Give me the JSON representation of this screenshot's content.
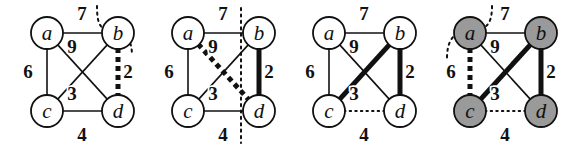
{
  "figure": {
    "title": "",
    "width": 564,
    "height": 147,
    "background": "#ffffff",
    "ink_color": "#111111",
    "node_fill_white": "#ffffff",
    "node_fill_gray": "#9a9a9a"
  },
  "graph": {
    "nodes": [
      {
        "id": "a",
        "label": "a",
        "x": 47,
        "y": 33
      },
      {
        "id": "b",
        "label": "b",
        "x": 118,
        "y": 33
      },
      {
        "id": "c",
        "label": "c",
        "x": 47,
        "y": 111
      },
      {
        "id": "d",
        "label": "d",
        "x": 118,
        "y": 111
      }
    ],
    "node_radius": 16,
    "edges": [
      {
        "id": "ab",
        "from": "a",
        "to": "b",
        "weight": 7,
        "label": "7",
        "label_x": 82,
        "label_y": 20
      },
      {
        "id": "ac",
        "from": "a",
        "to": "c",
        "weight": 6,
        "label": "6",
        "label_x": 28,
        "label_y": 78
      },
      {
        "id": "ad",
        "from": "a",
        "to": "d",
        "weight": 9,
        "label": "9",
        "label_x": 72,
        "label_y": 53
      },
      {
        "id": "bc",
        "from": "b",
        "to": "c",
        "weight": 3,
        "label": "3",
        "label_x": 72,
        "label_y": 100
      },
      {
        "id": "bd",
        "from": "b",
        "to": "d",
        "weight": 2,
        "label": "2",
        "label_x": 128,
        "label_y": 78
      },
      {
        "id": "cd",
        "from": "c",
        "to": "d",
        "weight": 4,
        "label": "4",
        "label_x": 82,
        "label_y": 141
      }
    ]
  },
  "panels": [
    {
      "index": 1,
      "name": "panel-1",
      "offset_x": 0,
      "node_style": "white",
      "edge_styles": {
        "ab": "thin-solid",
        "ac": "thin-solid",
        "ad": "thin-solid",
        "bc": "thin-solid",
        "bd": "bold-dashed",
        "cd": "thin-solid"
      },
      "cut": {
        "type": "curved",
        "visible": true
      },
      "highlighted_edges": [
        "bd"
      ],
      "highlighted_nodes": []
    },
    {
      "index": 2,
      "name": "panel-2",
      "offset_x": 141,
      "node_style": "white",
      "edge_styles": {
        "ab": "thin-solid",
        "ac": "thin-solid",
        "ad": "bold-dashed",
        "bc": "thin-solid",
        "bd": "thick-solid",
        "cd": "thin-solid"
      },
      "cut": {
        "type": "vertical",
        "visible": true
      },
      "highlighted_edges": [
        "bd",
        "ad"
      ],
      "highlighted_nodes": []
    },
    {
      "index": 3,
      "name": "panel-3",
      "offset_x": 282,
      "node_style": "white",
      "edge_styles": {
        "ab": "thin-solid",
        "ac": "thin-solid",
        "ad": "thin-solid",
        "bc": "thick-solid",
        "bd": "thick-solid",
        "cd": "thin-dotted"
      },
      "cut": {
        "type": "none",
        "visible": false
      },
      "highlighted_edges": [
        "bc",
        "bd"
      ],
      "highlighted_nodes": []
    },
    {
      "index": 4,
      "name": "panel-4",
      "offset_x": 423,
      "node_style": "gray",
      "edge_styles": {
        "ab": "thin-solid",
        "ac": "bold-dashed",
        "ad": "thin-solid",
        "bc": "thick-solid",
        "bd": "thick-solid",
        "cd": "thin-dotted"
      },
      "cut": {
        "type": "corner",
        "visible": true
      },
      "highlighted_edges": [
        "ac",
        "bc",
        "bd"
      ],
      "highlighted_nodes": [
        "a",
        "b",
        "c",
        "d"
      ]
    }
  ]
}
